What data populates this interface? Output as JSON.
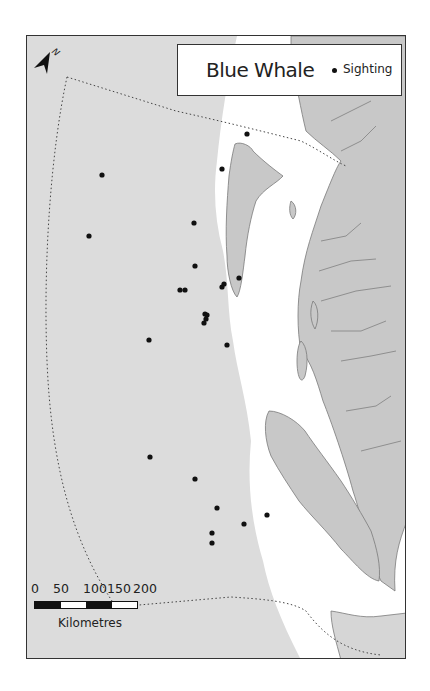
{
  "map": {
    "title": "Blue Whale",
    "legend": {
      "symbol": "dot",
      "label": "Sighting"
    },
    "north_arrow": {
      "label": "N",
      "icon": "north-arrow-icon"
    },
    "scale_bar": {
      "ticks": [
        "0",
        "50",
        "100",
        "150",
        "200"
      ],
      "unit": "Kilometres",
      "segments": [
        "black",
        "white",
        "black",
        "white"
      ]
    },
    "colors": {
      "ocean_deep": "#dcdcdc",
      "ocean_shallow": "#ffffff",
      "land": "#c8c8c8",
      "coastline": "#7a7a7a",
      "sighting": "#111111",
      "boundary": "#444444"
    },
    "sightings": [
      {
        "x": 246,
        "y": 133
      },
      {
        "x": 221,
        "y": 168
      },
      {
        "x": 101,
        "y": 174
      },
      {
        "x": 88,
        "y": 235
      },
      {
        "x": 193,
        "y": 222
      },
      {
        "x": 194,
        "y": 265
      },
      {
        "x": 179,
        "y": 289
      },
      {
        "x": 184,
        "y": 289
      },
      {
        "x": 221,
        "y": 286
      },
      {
        "x": 223,
        "y": 283
      },
      {
        "x": 238,
        "y": 277
      },
      {
        "x": 204,
        "y": 313
      },
      {
        "x": 206,
        "y": 314
      },
      {
        "x": 205,
        "y": 318
      },
      {
        "x": 203,
        "y": 322
      },
      {
        "x": 148,
        "y": 339
      },
      {
        "x": 226,
        "y": 344
      },
      {
        "x": 149,
        "y": 456
      },
      {
        "x": 194,
        "y": 478
      },
      {
        "x": 216,
        "y": 507
      },
      {
        "x": 266,
        "y": 514
      },
      {
        "x": 243,
        "y": 523
      },
      {
        "x": 211,
        "y": 532
      },
      {
        "x": 211,
        "y": 542
      }
    ]
  }
}
